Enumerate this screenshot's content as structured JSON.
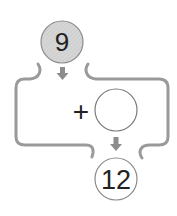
{
  "diagram": {
    "input_value": "9",
    "operator": "+",
    "operand_value": "",
    "output_value": "12",
    "colors": {
      "input_fill": "#d4d4d4",
      "circle_stroke": "#8a8a8a",
      "path_stroke": "#9a9a9a",
      "arrow_fill": "#8c8c8c",
      "text": "#222222"
    }
  }
}
